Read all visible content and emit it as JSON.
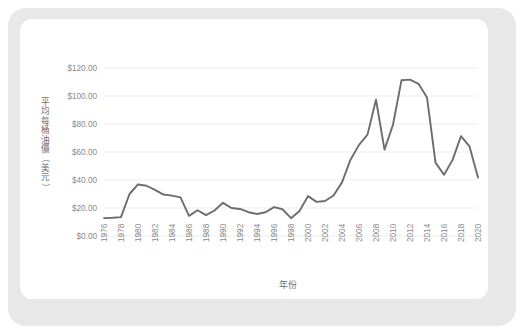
{
  "figure": {
    "background_color": "#e8e8e8",
    "card_color": "#ffffff",
    "line_color": "#6d6d6d",
    "grid_color": "#e6e6e6",
    "tick_text_color": "#8a8a8a"
  },
  "axis": {
    "y_title": "平均每桶油價（美元）",
    "y_title_chars": [
      "平",
      "均",
      "每",
      "桶",
      "油",
      "價",
      "（",
      "美",
      "元",
      "）"
    ],
    "x_title": "年份",
    "y_ticks": [
      "$0.00",
      "$20.00",
      "$40.00",
      "$60.00",
      "$80.00",
      "$100.00",
      "$120.00"
    ],
    "x_ticks": [
      "1976",
      "1978",
      "1980",
      "1982",
      "1984",
      "1986",
      "1988",
      "1990",
      "1992",
      "1994",
      "1996",
      "1998",
      "2000",
      "2002",
      "2004",
      "2006",
      "2008",
      "2010",
      "2012",
      "2014",
      "2016",
      "2018",
      "2020"
    ]
  },
  "chart_data": {
    "type": "line",
    "title": "",
    "subtitle": "",
    "xlabel": "年份",
    "ylabel": "平均每桶油價（美元）",
    "xlim": [
      1976,
      2020
    ],
    "ylim": [
      0,
      120
    ],
    "grid": true,
    "legend": false,
    "x": [
      1976,
      1977,
      1978,
      1979,
      1980,
      1981,
      1982,
      1983,
      1984,
      1985,
      1986,
      1987,
      1988,
      1989,
      1990,
      1991,
      1992,
      1993,
      1994,
      1995,
      1996,
      1997,
      1998,
      1999,
      2000,
      2001,
      2002,
      2003,
      2004,
      2005,
      2006,
      2007,
      2008,
      2009,
      2010,
      2011,
      2012,
      2013,
      2014,
      2015,
      2016,
      2017,
      2018,
      2019,
      2020
    ],
    "series": [
      {
        "name": "平均每桶油價",
        "values": [
          12.8,
          13.0,
          13.5,
          30.0,
          36.8,
          35.9,
          32.9,
          29.6,
          28.8,
          27.6,
          14.4,
          18.4,
          14.9,
          18.2,
          23.7,
          20.0,
          19.3,
          17.0,
          15.7,
          17.0,
          20.6,
          19.1,
          12.7,
          17.8,
          28.5,
          24.4,
          25.0,
          28.9,
          38.3,
          54.5,
          65.1,
          72.4,
          97.3,
          61.7,
          79.5,
          111.3,
          111.7,
          108.7,
          99.0,
          52.4,
          43.7,
          54.2,
          71.3,
          64.0,
          41.8
        ]
      }
    ]
  }
}
